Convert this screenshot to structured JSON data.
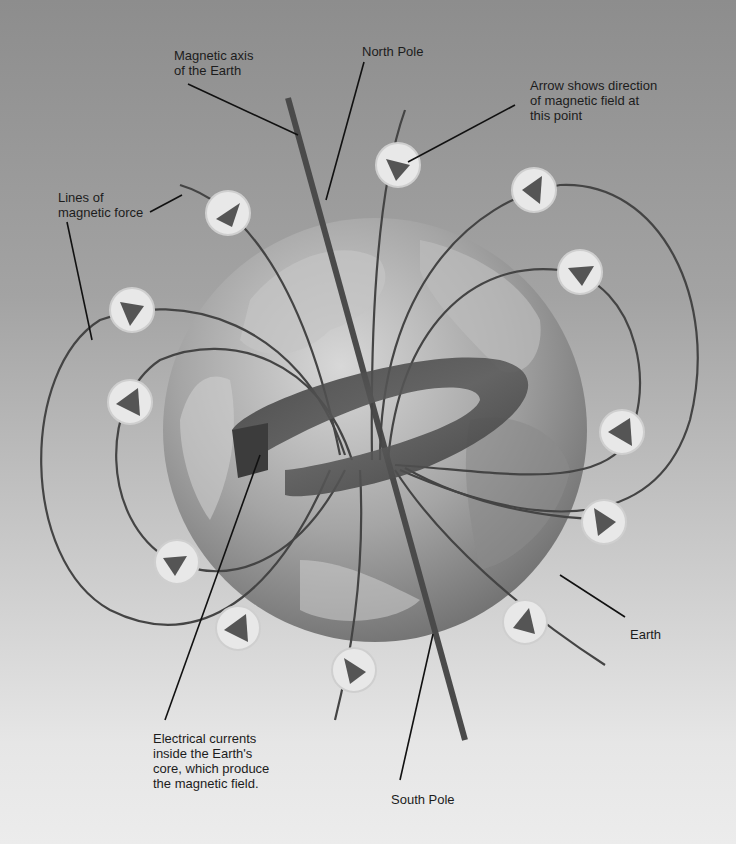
{
  "diagram": {
    "title": "",
    "labels": {
      "magnetic_axis": "Magnetic axis\nof the Earth",
      "north_pole": "North Pole",
      "arrow_direction": "Arrow shows direction\nof magnetic field at\nthis point",
      "lines_of_force": "Lines of\nmagnetic force",
      "electrical_currents": "Electrical currents\ninside the Earth's\ncore, which produce\nthe magnetic field.",
      "south_pole": "South Pole",
      "earth": "Earth"
    },
    "colors": {
      "background_top": "#8d8d8d",
      "background_bottom": "#ececec",
      "field_line": "#444444",
      "arrow_marker_fill": "#e8e8e8",
      "arrow_glyph": "#555555",
      "core_ring": "#4a4a4a",
      "axis_bar": "#4a4a4a"
    }
  }
}
